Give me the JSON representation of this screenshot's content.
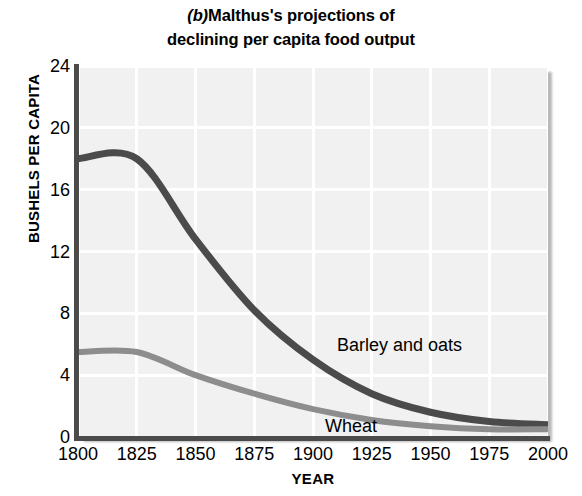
{
  "title": {
    "panel_letter": "(b)",
    "line1": "Malthus's projections of",
    "line2": "declining per capita food output"
  },
  "chart_data": {
    "type": "line",
    "xlabel": "YEAR",
    "ylabel": "BUSHELS PER CAPITA",
    "xlim": [
      1800,
      2000
    ],
    "ylim": [
      0,
      24
    ],
    "xticks": [
      "1800",
      "1825",
      "1850",
      "1875",
      "1900",
      "1925",
      "1950",
      "1975",
      "2000"
    ],
    "yticks": [
      "0",
      "4",
      "8",
      "12",
      "16",
      "20",
      "24"
    ],
    "grid": true,
    "legend_position": "inline-annotations",
    "x": [
      1800,
      1825,
      1850,
      1875,
      1900,
      1925,
      1950,
      1975,
      2000
    ],
    "series": [
      {
        "name": "Barley and oats",
        "color": "#4b4b4b",
        "values": [
          18.0,
          18.0,
          12.8,
          8.2,
          5.0,
          2.8,
          1.6,
          1.0,
          0.8
        ]
      },
      {
        "name": "Wheat",
        "color": "#8d8d8d",
        "values": [
          5.5,
          5.5,
          4.0,
          2.8,
          1.8,
          1.1,
          0.7,
          0.5,
          0.5
        ]
      }
    ],
    "annotations": [
      {
        "text": "Barley and oats",
        "x": 1911,
        "y": 9.4
      },
      {
        "text": "Wheat",
        "x": 1906,
        "y": 4.2
      }
    ]
  },
  "colors": {
    "plot_background": "#f1f1f1",
    "gridline": "#ffffff",
    "axis": "#4b4b4b",
    "barley_line": "#4b4b4b",
    "wheat_line": "#8d8d8d",
    "text": "#000000"
  }
}
